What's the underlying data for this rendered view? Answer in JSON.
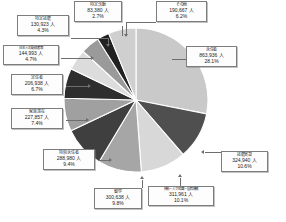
{
  "chart_data": {
    "type": "pie",
    "title": "",
    "unit_suffix": "人",
    "total_label": "",
    "legend_position": "callout-labels",
    "grid": false,
    "start_angle_deg": 0,
    "direction": "clockwise",
    "categories": [
      "永住者",
      "技能実習",
      "技術・人文知識・国際業務",
      "留学",
      "特別永住者",
      "家族滞在",
      "定住者",
      "日本人の配偶者等",
      "特定技能",
      "特定活動",
      "その他"
    ],
    "values": [
      863936,
      324940,
      311961,
      300638,
      288980,
      227857,
      206938,
      144993,
      130923,
      83380,
      190667
    ],
    "percents": [
      28.1,
      10.6,
      10.1,
      9.8,
      9.4,
      7.4,
      6.7,
      4.7,
      4.3,
      2.7,
      6.2
    ],
    "colors": [
      "#c9c9c9",
      "#4f4f4f",
      "#d8d8d8",
      "#a6a6a6",
      "#3f3f3f",
      "#a0a0a0",
      "#2e2e2e",
      "#dcdcdc",
      "#9a9a9a",
      "#222222",
      "#cfcfcf"
    ],
    "slices": [
      {
        "name": "永住者",
        "value_text": "863,936 人",
        "percent_text": "28.1%",
        "color": "#c9c9c9"
      },
      {
        "name": "技能実習",
        "value_text": "324,940 人",
        "percent_text": "10.6%",
        "color": "#4f4f4f"
      },
      {
        "name": "技術・人文知識・国際業務",
        "value_text": "311,961 人",
        "percent_text": "10.1%",
        "color": "#d8d8d8"
      },
      {
        "name": "留学",
        "value_text": "300,638 人",
        "percent_text": "9.8%",
        "color": "#a6a6a6"
      },
      {
        "name": "特別永住者",
        "value_text": "288,980 人",
        "percent_text": "9.4%",
        "color": "#3f3f3f"
      },
      {
        "name": "家族滞在",
        "value_text": "227,857 人",
        "percent_text": "7.4%",
        "color": "#a0a0a0"
      },
      {
        "name": "定住者",
        "value_text": "206,938 人",
        "percent_text": "6.7%",
        "color": "#2e2e2e"
      },
      {
        "name": "日本人の配偶者等",
        "value_text": "144,993 人",
        "percent_text": "4.7%",
        "color": "#dcdcdc"
      },
      {
        "name": "特定技能",
        "value_text": "130,923 人",
        "percent_text": "4.3%",
        "color": "#9a9a9a"
      },
      {
        "name": "特定活動",
        "value_text": "83,380 人",
        "percent_text": "2.7%",
        "color": "#222222"
      },
      {
        "name": "その他",
        "value_text": "190,667 人",
        "percent_text": "6.2%",
        "color": "#cfcfcf"
      }
    ]
  },
  "labels": {
    "other": {
      "title": "その他",
      "value": "190,667 人",
      "percent": "6.2%"
    },
    "permanent": {
      "title": "永住者",
      "value": "863,936 人",
      "percent": "28.1%"
    },
    "trainee": {
      "title": "技能実習",
      "value": "324,940 人",
      "percent": "10.6%"
    },
    "engineer": {
      "title": "技術・人文知識・国際業務",
      "value": "311,961 人",
      "percent": "10.1%"
    },
    "student": {
      "title": "留学",
      "value": "300,638 人",
      "percent": "9.8%"
    },
    "special_perm": {
      "title": "特別永住者",
      "value": "288,980 人",
      "percent": "9.4%"
    },
    "family": {
      "title": "家族滞在",
      "value": "227,857 人",
      "percent": "7.4%"
    },
    "longterm": {
      "title": "定住者",
      "value": "206,938 人",
      "percent": "6.7%"
    },
    "spouse_jp": {
      "title": "日本人の配偶者等",
      "value": "144,993 人",
      "percent": "4.7%"
    },
    "skilled": {
      "title": "特定技能",
      "value": "130,923 人",
      "percent": "4.3%"
    },
    "designated": {
      "title": "特定活動",
      "value": "83,380 人",
      "percent": "2.7%"
    }
  }
}
